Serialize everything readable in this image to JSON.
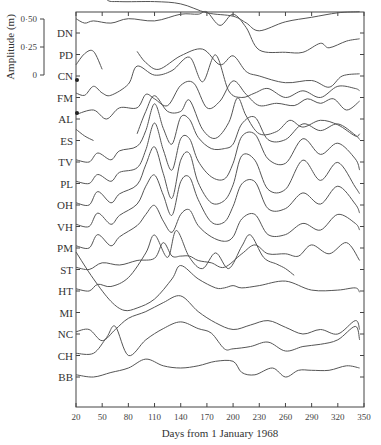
{
  "chart_data": {
    "type": "line",
    "title": "",
    "xlabel": "Days from 1 January 1968",
    "ylabel": "Amplitude (m)",
    "x_ticks": [
      20,
      50,
      80,
      110,
      140,
      170,
      200,
      230,
      260,
      290,
      320,
      350
    ],
    "xlim": [
      20,
      350
    ],
    "amplitude_scale": {
      "ticks": [
        "0·50",
        "0·25",
        "0"
      ],
      "values": [
        0.5,
        0.25,
        0
      ]
    },
    "grid": false,
    "legend": "none (station labels on left axis)",
    "stations": [
      "DN",
      "PD",
      "CN",
      "FM",
      "AL",
      "ES",
      "TV",
      "PL",
      "OH",
      "VH",
      "PM",
      "ST",
      "HT",
      "MI",
      "NC",
      "CH",
      "BB"
    ],
    "series": [
      {
        "name": "DN",
        "x": [
          20,
          35,
          47,
          55,
          70,
          110,
          140,
          170,
          200,
          215,
          230,
          260,
          290,
          320,
          345
        ],
        "values": [
          0.38,
          0.38,
          0.44,
          0.3,
          0.28,
          0.28,
          0.26,
          0.18,
          0.15,
          0.09,
          0.02,
          0.1,
          0.14,
          0.18,
          0.19
        ]
      },
      {
        "name": "PD",
        "x": [
          20,
          30,
          40,
          60,
          80,
          110,
          140,
          160,
          170,
          185,
          200,
          215,
          230,
          260,
          280,
          300,
          310,
          330,
          345
        ],
        "values": [
          0.32,
          0.28,
          0.3,
          0.28,
          0.32,
          0.3,
          0.36,
          0.36,
          0.38,
          0.26,
          0.36,
          0.24,
          0.04,
          0.02,
          0.02,
          0.1,
          0.06,
          0.12,
          0.14
        ]
      },
      {
        "name": "CN",
        "x": [
          20,
          30,
          40,
          50,
          90,
          100,
          115,
          140,
          165,
          185,
          200,
          215,
          230,
          260,
          290,
          310,
          325,
          345
        ],
        "values": [
          0.1,
          0.2,
          0.22,
          0.06,
          0.22,
          0.12,
          0.06,
          0.18,
          0.24,
          0.1,
          0.18,
          0.04,
          0.0,
          -0.06,
          -0.04,
          -0.1,
          0.0,
          0.02
        ]
      },
      {
        "name": "FM",
        "x": [
          20,
          30,
          40,
          50,
          60,
          80,
          90,
          110,
          130,
          150,
          165,
          180,
          195,
          210,
          225,
          240,
          260,
          280,
          300,
          320,
          340,
          345
        ],
        "values": [
          0.04,
          0.02,
          0.1,
          0.04,
          0.02,
          0.12,
          0.28,
          0.2,
          0.24,
          0.36,
          0.14,
          0.38,
          0.06,
          0.0,
          0.04,
          0.08,
          0.0,
          0.06,
          0.0,
          0.1,
          0.08,
          0.06
        ]
      },
      {
        "name": "AL",
        "x": [
          20,
          40,
          55,
          70,
          90,
          100,
          110,
          125,
          140,
          155,
          170,
          185,
          200,
          215,
          230,
          250,
          270,
          285,
          300,
          315,
          330,
          345
        ],
        "values": [
          0.04,
          0.08,
          0.0,
          0.1,
          0.1,
          0.22,
          0.18,
          0.12,
          0.3,
          0.32,
          0.1,
          0.16,
          0.34,
          0.22,
          0.12,
          0.14,
          0.12,
          0.18,
          0.14,
          0.18,
          0.08,
          0.16
        ]
      },
      {
        "name": "ES",
        "x": [
          20,
          30,
          40,
          90,
          100,
          110,
          125,
          140,
          150,
          165,
          180,
          195,
          205,
          215,
          230,
          250,
          265,
          280,
          300,
          320,
          340,
          345
        ],
        "values": [
          0.1,
          0.04,
          0.0,
          0.06,
          0.26,
          0.4,
          0.26,
          0.26,
          0.36,
          0.1,
          0.02,
          0.16,
          0.38,
          0.22,
          0.06,
          0.08,
          0.18,
          0.12,
          0.18,
          0.14,
          0.04,
          0.06
        ]
      },
      {
        "name": "TV",
        "x": [
          20,
          35,
          45,
          60,
          70,
          90,
          100,
          110,
          120,
          130,
          140,
          150,
          160,
          175,
          190,
          200,
          210,
          225,
          240,
          260,
          280,
          300,
          320,
          340,
          345
        ],
        "values": [
          0.02,
          0.0,
          0.08,
          0.02,
          0.1,
          0.14,
          0.28,
          0.52,
          0.3,
          0.16,
          0.4,
          0.38,
          0.22,
          0.12,
          0.12,
          0.16,
          0.34,
          0.4,
          0.2,
          0.2,
          0.34,
          0.28,
          0.34,
          0.24,
          0.2
        ]
      },
      {
        "name": "PL",
        "x": [
          20,
          35,
          45,
          60,
          70,
          90,
          100,
          110,
          120,
          130,
          140,
          150,
          160,
          175,
          190,
          200,
          210,
          225,
          240,
          260,
          280,
          300,
          320,
          340,
          345
        ],
        "values": [
          0.02,
          0.0,
          0.08,
          0.02,
          0.1,
          0.14,
          0.3,
          0.54,
          0.3,
          0.12,
          0.4,
          0.4,
          0.2,
          0.06,
          0.04,
          0.18,
          0.42,
          0.44,
          0.22,
          0.18,
          0.4,
          0.26,
          0.36,
          0.22,
          0.12
        ]
      },
      {
        "name": "OH",
        "x": [
          20,
          35,
          45,
          60,
          70,
          90,
          100,
          110,
          120,
          130,
          140,
          150,
          160,
          175,
          190,
          200,
          210,
          225,
          240,
          260,
          280,
          300,
          320,
          340,
          345
        ],
        "values": [
          0.02,
          0.0,
          0.12,
          0.02,
          0.1,
          0.18,
          0.36,
          0.52,
          0.28,
          0.06,
          0.4,
          0.46,
          0.2,
          0.02,
          0.04,
          0.18,
          0.44,
          0.4,
          0.14,
          0.14,
          0.4,
          0.22,
          0.38,
          0.16,
          0.1
        ]
      },
      {
        "name": "VH",
        "x": [
          20,
          35,
          45,
          60,
          70,
          90,
          100,
          110,
          120,
          130,
          140,
          150,
          160,
          175,
          190,
          200,
          210,
          225,
          240,
          260,
          280,
          300,
          320,
          340,
          345
        ],
        "values": [
          0.02,
          0.0,
          0.12,
          0.02,
          0.1,
          0.2,
          0.36,
          0.46,
          0.28,
          0.1,
          0.4,
          0.44,
          0.24,
          0.04,
          0.04,
          0.18,
          0.38,
          0.4,
          0.16,
          0.16,
          0.3,
          0.2,
          0.36,
          0.2,
          0.12
        ]
      },
      {
        "name": "PM",
        "x": [
          20,
          35,
          45,
          60,
          70,
          90,
          100,
          110,
          120,
          130,
          140,
          150,
          160,
          175,
          190,
          200,
          210,
          225,
          240,
          260,
          280,
          300,
          320,
          340,
          345
        ],
        "values": [
          0.02,
          0.0,
          0.12,
          0.02,
          0.1,
          0.2,
          0.3,
          0.38,
          0.24,
          0.14,
          0.3,
          0.34,
          0.2,
          0.1,
          0.06,
          0.1,
          0.26,
          0.3,
          0.12,
          0.12,
          0.22,
          0.16,
          0.3,
          0.22,
          0.16
        ]
      },
      {
        "name": "ST",
        "x": [
          20,
          35,
          50,
          70,
          90,
          110,
          120,
          130,
          140,
          150,
          160,
          175,
          190,
          210,
          225,
          240,
          260,
          275,
          290,
          310,
          330,
          345
        ],
        "values": [
          0.02,
          0.0,
          0.06,
          0.04,
          0.08,
          0.1,
          0.24,
          0.12,
          0.12,
          0.12,
          0.08,
          0.06,
          0.02,
          0.14,
          0.22,
          0.14,
          0.14,
          0.12,
          0.22,
          0.14,
          0.24,
          0.08
        ]
      },
      {
        "name": "HT",
        "x": [
          20,
          35,
          45,
          60,
          80,
          100,
          110,
          125,
          135,
          150,
          165,
          180,
          195,
          210,
          220,
          235,
          250,
          260,
          270
        ],
        "values": [
          0.02,
          0.0,
          0.06,
          0.04,
          0.12,
          0.34,
          0.5,
          0.3,
          0.54,
          0.3,
          0.2,
          0.34,
          0.2,
          0.4,
          0.5,
          0.3,
          0.24,
          0.2,
          0.14
        ]
      },
      {
        "name": "MI",
        "x": [
          20,
          40,
          60,
          75,
          90,
          110,
          130,
          140,
          160,
          180,
          190,
          200,
          210,
          230,
          260,
          290,
          320,
          340,
          345
        ],
        "values": [
          0.54,
          0.3,
          0.1,
          0.02,
          0.04,
          0.12,
          0.3,
          0.42,
          0.3,
          0.22,
          0.22,
          0.24,
          0.22,
          0.24,
          0.28,
          0.2,
          0.2,
          0.22,
          0.18
        ]
      },
      {
        "name": "NC",
        "x": [
          20,
          35,
          50,
          65,
          80,
          100,
          120,
          140,
          160,
          180,
          200,
          220,
          240,
          260,
          280,
          300,
          320,
          340,
          345
        ],
        "values": [
          0.02,
          0.04,
          -0.06,
          0.04,
          0.14,
          0.2,
          0.28,
          0.34,
          0.2,
          0.1,
          0.04,
          0.08,
          0.12,
          0.06,
          0.0,
          0.04,
          0.0,
          0.12,
          0.04
        ]
      },
      {
        "name": "CH",
        "x": [
          20,
          40,
          55,
          65,
          80,
          100,
          120,
          140,
          160,
          175,
          190,
          200,
          220,
          240,
          260,
          280,
          300,
          320,
          340,
          345
        ],
        "values": [
          0.02,
          0.02,
          0.16,
          0.26,
          0.0,
          0.14,
          0.24,
          0.3,
          0.24,
          0.2,
          0.06,
          0.06,
          0.08,
          0.12,
          0.04,
          0.08,
          0.1,
          0.14,
          0.26,
          0.14
        ]
      },
      {
        "name": "BB",
        "x": [
          20,
          40,
          60,
          80,
          100,
          120,
          140,
          160,
          180,
          200,
          210,
          225,
          245,
          260,
          275,
          290,
          310,
          330,
          345
        ],
        "values": [
          0.02,
          0.0,
          0.04,
          0.08,
          0.16,
          0.1,
          0.08,
          0.1,
          0.14,
          0.14,
          0.04,
          0.02,
          0.08,
          0.0,
          0.06,
          0.06,
          0.06,
          0.1,
          0.08
        ]
      }
    ]
  },
  "axis": {
    "xlabel": "Days from 1 January 1968",
    "ylabel": "Amplitude (m)",
    "x_ticks": [
      "20",
      "50",
      "80",
      "110",
      "140",
      "170",
      "200",
      "230",
      "260",
      "290",
      "320",
      "350"
    ],
    "scale_ticks": [
      "0·50",
      "0·25",
      "0"
    ]
  }
}
